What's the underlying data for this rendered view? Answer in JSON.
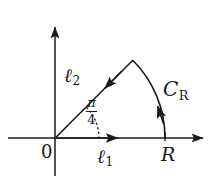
{
  "figure": {
    "type": "contour-diagram",
    "background_color": "#ffffff",
    "stroke_color": "#1a1a1a",
    "labels": {
      "origin": "0",
      "radius": "R",
      "segment_real": "ℓ",
      "segment_real_sub": "1",
      "segment_ray": "ℓ",
      "segment_ray_sub": "2",
      "arc": "C",
      "arc_sub": "R",
      "angle_numerator": "π",
      "angle_denominator": "4"
    },
    "geometry": {
      "origin_px": [
        55,
        138
      ],
      "radius_px": 110,
      "sector_angle_deg": 45,
      "x_axis_arrow_tip_px": [
        207,
        138
      ],
      "y_axis_arrow_tip_px": [
        55,
        22
      ],
      "arc_end_on_axis_px": [
        165,
        138
      ],
      "arc_apex_px": [
        128,
        61
      ]
    }
  }
}
